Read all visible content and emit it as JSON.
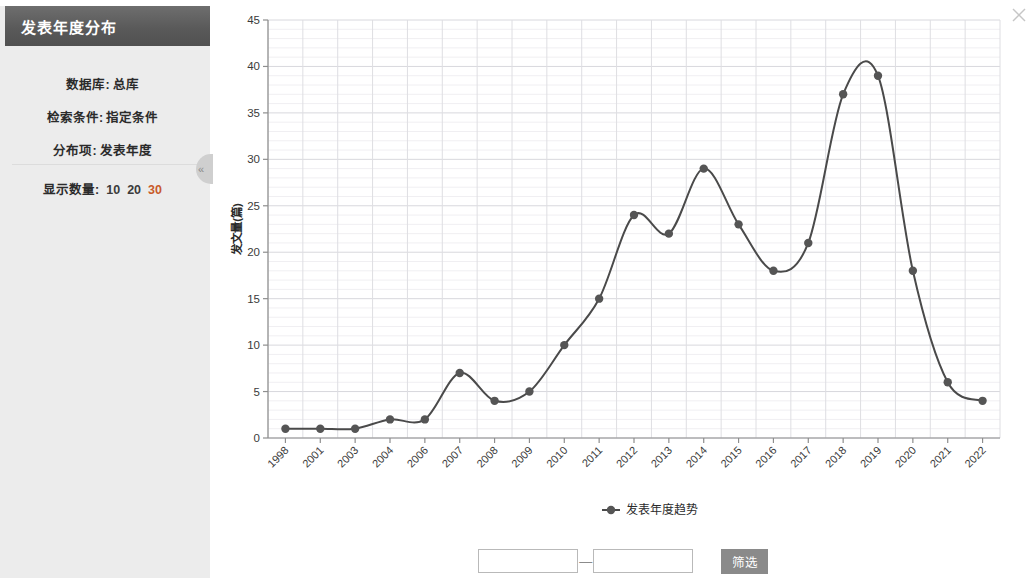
{
  "window": {
    "close_icon": "close-icon"
  },
  "sidebar": {
    "title": "发表年度分布",
    "collapse_icon": "«",
    "info": [
      {
        "label": "数据库:",
        "value": "总库"
      },
      {
        "label": "检索条件:",
        "value": "指定条件"
      },
      {
        "label": "分布项:",
        "value": "发表年度"
      }
    ],
    "count": {
      "label": "显示数量:",
      "options": [
        "10",
        "20",
        "30"
      ],
      "active": "30",
      "active_color": "#c85a2a"
    }
  },
  "filter_bar": {
    "from_value": "",
    "from_placeholder": "",
    "separator": "—",
    "to_value": "",
    "to_placeholder": "",
    "button_label": "筛选"
  },
  "chart_data": {
    "type": "line",
    "title": "",
    "xlabel": "",
    "ylabel": "发文量(篇)",
    "legend": [
      "发表年度趋势"
    ],
    "legend_position": "bottom",
    "grid": true,
    "ylim": [
      0,
      45
    ],
    "yticks": [
      0,
      5,
      10,
      15,
      20,
      25,
      30,
      35,
      40,
      45
    ],
    "minor_y_step": 1,
    "line_color": "#4a4a4a",
    "marker_color": "#555555",
    "categories": [
      "1998",
      "2001",
      "2003",
      "2004",
      "2006",
      "2007",
      "2008",
      "2009",
      "2010",
      "2011",
      "2012",
      "2013",
      "2014",
      "2015",
      "2016",
      "2017",
      "2018",
      "2019",
      "2020",
      "2021",
      "2022"
    ],
    "series": [
      {
        "name": "发表年度趋势",
        "values": [
          1,
          1,
          1,
          2,
          2,
          7,
          4,
          5,
          10,
          15,
          24,
          22,
          29,
          23,
          18,
          21,
          37,
          39,
          18,
          6,
          4
        ]
      }
    ]
  }
}
